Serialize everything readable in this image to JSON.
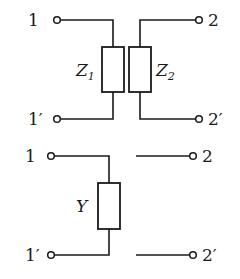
{
  "diagram": {
    "type": "two-port networks",
    "circuits": [
      {
        "id": "series-impedance-pair",
        "terminals": {
          "in_top": "1",
          "in_bottom": "1′",
          "out_top": "2",
          "out_bottom": "2′"
        },
        "elements": [
          {
            "symbol": "Z",
            "subscript": "1",
            "kind": "impedance"
          },
          {
            "symbol": "Z",
            "subscript": "2",
            "kind": "impedance"
          }
        ]
      },
      {
        "id": "shunt-admittance",
        "terminals": {
          "in_top": "1",
          "in_bottom": "1′",
          "out_top": "2",
          "out_bottom": "2′"
        },
        "elements": [
          {
            "symbol": "Y",
            "kind": "admittance"
          }
        ]
      }
    ]
  }
}
